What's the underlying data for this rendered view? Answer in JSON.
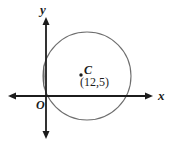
{
  "figure": {
    "type": "coordinate-plane-circle-diagram",
    "background_color": "#ffffff",
    "width": 173,
    "height": 142
  },
  "axes": {
    "y_label": "y",
    "x_label": "x",
    "origin_label": "O",
    "color": "#1c1c1c",
    "x_axis": {
      "y": 96,
      "x_start": 8,
      "x_end": 152,
      "arrows": "both"
    },
    "y_axis": {
      "x": 46,
      "y_start": 18,
      "y_end": 138,
      "arrows": "both"
    }
  },
  "circle": {
    "center_label": "C",
    "center_coords": "(12,5)",
    "stroke_color": "#6e6e6e",
    "fill": "none",
    "pixel_center_x": 87,
    "pixel_center_y": 76,
    "pixel_radius": 44,
    "center_dot_x": 81,
    "center_dot_y": 75,
    "center_dot_color": "#1c1c1c"
  }
}
